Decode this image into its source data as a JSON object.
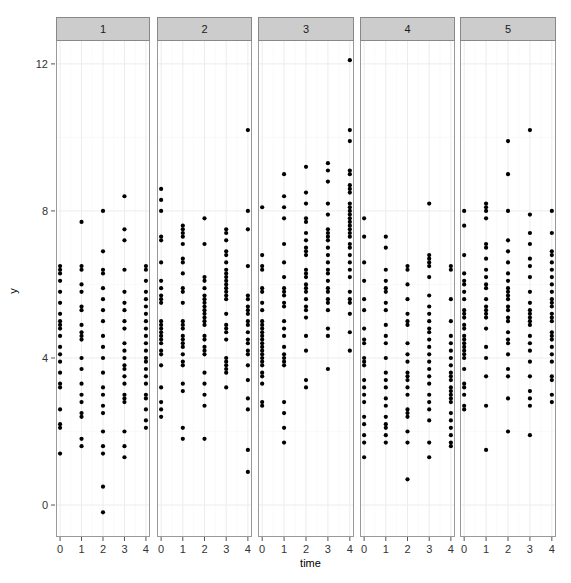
{
  "chart_data": {
    "type": "scatter",
    "title": "",
    "xlabel": "time",
    "ylabel": "y",
    "facet_labels": [
      "1",
      "2",
      "3",
      "4",
      "5"
    ],
    "x_ticks": [
      0,
      1,
      2,
      3,
      4
    ],
    "y_ticks": [
      0,
      4,
      8,
      12
    ],
    "xlim": [
      -0.19,
      4.19
    ],
    "ylim": [
      -0.87,
      12.65
    ],
    "grid": true,
    "legend": null,
    "colors": {
      "point": "#000000",
      "strip_bg": "#cccccc",
      "strip_border": "#888888",
      "panel_border": "#999999",
      "grid_major": "#ececec",
      "grid_minor": "#f6f6f6",
      "text": "#000000",
      "tick_text": "#333333"
    },
    "panels": [
      {
        "facet": "1",
        "series": [
          {
            "x": 0,
            "values": [
              6.5,
              6.4,
              6.3,
              6.1,
              5.8,
              5.5,
              5.2,
              5.0,
              4.9,
              4.8,
              4.6,
              4.3,
              4.1,
              3.9,
              3.6,
              3.3,
              3.2,
              2.6,
              2.2,
              2.1,
              1.4
            ]
          },
          {
            "x": 1,
            "values": [
              7.7,
              6.5,
              6.4,
              6.0,
              5.8,
              5.4,
              5.3,
              4.9,
              4.7,
              4.6,
              4.5,
              4.0,
              3.7,
              3.3,
              3.0,
              2.8,
              2.5,
              2.4,
              1.8,
              1.6
            ]
          },
          {
            "x": 2,
            "values": [
              8.0,
              6.9,
              6.4,
              6.3,
              5.9,
              5.6,
              5.3,
              5.0,
              4.6,
              4.3,
              4.0,
              3.6,
              3.2,
              3.0,
              2.7,
              2.5,
              2.0,
              1.6,
              1.4,
              0.5,
              -0.2
            ]
          },
          {
            "x": 3,
            "values": [
              8.4,
              7.5,
              7.2,
              6.4,
              5.8,
              5.5,
              5.3,
              5.0,
              4.8,
              4.4,
              4.2,
              4.0,
              3.8,
              3.7,
              3.5,
              3.3,
              3.0,
              2.9,
              2.8,
              2.0,
              1.6,
              1.3
            ]
          },
          {
            "x": 4,
            "values": [
              6.5,
              6.4,
              6.1,
              5.8,
              5.6,
              5.4,
              5.2,
              5.0,
              4.8,
              4.6,
              4.4,
              4.2,
              4.0,
              3.9,
              3.7,
              3.5,
              3.3,
              3.0,
              2.9,
              2.6,
              2.3,
              2.1
            ]
          }
        ]
      },
      {
        "facet": "2",
        "series": [
          {
            "x": 0,
            "values": [
              8.6,
              8.3,
              8.0,
              7.3,
              7.2,
              6.6,
              6.1,
              5.9,
              5.7,
              5.6,
              5.5,
              5.0,
              4.9,
              4.8,
              4.7,
              4.6,
              4.5,
              4.4,
              4.2,
              4.1,
              3.8,
              3.2,
              2.8,
              2.6,
              2.4
            ]
          },
          {
            "x": 1,
            "values": [
              7.6,
              7.5,
              7.4,
              7.3,
              7.1,
              6.7,
              6.6,
              6.3,
              5.9,
              5.8,
              5.5,
              5.0,
              4.9,
              4.8,
              4.6,
              4.5,
              4.4,
              4.3,
              4.1,
              3.9,
              3.8,
              3.3,
              3.1,
              2.1,
              1.8
            ]
          },
          {
            "x": 2,
            "values": [
              7.8,
              7.1,
              6.2,
              6.1,
              5.9,
              5.7,
              5.6,
              5.5,
              5.4,
              5.3,
              5.2,
              5.1,
              5.0,
              4.9,
              4.6,
              4.5,
              4.3,
              4.2,
              4.1,
              3.6,
              3.3,
              3.0,
              2.7,
              1.8
            ]
          },
          {
            "x": 3,
            "values": [
              7.5,
              7.4,
              7.2,
              6.9,
              6.8,
              6.6,
              6.4,
              6.3,
              6.2,
              6.1,
              6.0,
              5.9,
              5.8,
              5.7,
              5.6,
              5.2,
              4.9,
              4.8,
              4.7,
              4.5,
              4.0,
              3.9,
              3.8,
              3.7,
              3.6,
              3.2
            ]
          },
          {
            "x": 4,
            "values": [
              10.2,
              8.0,
              7.5,
              6.5,
              5.7,
              5.6,
              5.4,
              5.3,
              5.2,
              5.0,
              4.9,
              4.7,
              4.5,
              4.4,
              4.2,
              4.1,
              3.8,
              3.4,
              2.9,
              2.6,
              1.5,
              0.9
            ]
          }
        ]
      },
      {
        "facet": "3",
        "series": [
          {
            "x": 0,
            "values": [
              8.1,
              6.8,
              6.5,
              6.4,
              5.9,
              5.8,
              5.5,
              5.3,
              5.0,
              4.9,
              4.8,
              4.7,
              4.6,
              4.5,
              4.4,
              4.3,
              4.2,
              4.1,
              4.0,
              3.9,
              3.8,
              3.6,
              3.5,
              3.3,
              2.8,
              2.7
            ]
          },
          {
            "x": 1,
            "values": [
              9.0,
              8.4,
              8.1,
              7.8,
              7.1,
              6.6,
              6.2,
              5.9,
              5.8,
              5.7,
              5.5,
              5.4,
              5.0,
              4.8,
              4.6,
              4.3,
              4.1,
              4.0,
              3.9,
              3.8,
              2.8,
              2.5,
              2.1,
              1.7
            ]
          },
          {
            "x": 2,
            "values": [
              9.2,
              8.5,
              8.2,
              7.8,
              7.7,
              7.4,
              7.2,
              7.0,
              6.9,
              6.8,
              6.4,
              6.3,
              6.2,
              6.0,
              5.9,
              5.8,
              5.6,
              5.4,
              5.3,
              5.1,
              4.6,
              4.2,
              3.4,
              3.2
            ]
          },
          {
            "x": 3,
            "values": [
              9.3,
              9.1,
              8.8,
              8.2,
              7.9,
              7.5,
              7.4,
              7.3,
              7.2,
              7.0,
              6.8,
              6.6,
              6.4,
              6.3,
              6.1,
              5.9,
              5.8,
              5.6,
              5.5,
              5.3,
              4.8,
              4.6,
              3.7
            ]
          },
          {
            "x": 4,
            "values": [
              12.1,
              10.2,
              9.9,
              9.1,
              9.0,
              8.7,
              8.6,
              8.5,
              8.2,
              8.1,
              8.0,
              7.9,
              7.8,
              7.7,
              7.6,
              7.5,
              7.4,
              7.3,
              7.1,
              7.0,
              6.8,
              6.6,
              6.4,
              6.2,
              5.8,
              5.6,
              5.5,
              5.2,
              4.7,
              4.2
            ]
          }
        ]
      },
      {
        "facet": "4",
        "series": [
          {
            "x": 0,
            "values": [
              7.8,
              7.3,
              6.6,
              6.1,
              5.6,
              5.3,
              4.8,
              4.5,
              4.4,
              4.0,
              3.9,
              3.8,
              3.4,
              3.2,
              3.0,
              2.8,
              2.4,
              2.2,
              1.9,
              1.7,
              1.3
            ]
          },
          {
            "x": 1,
            "values": [
              7.3,
              7.0,
              6.4,
              6.1,
              5.9,
              5.8,
              5.5,
              5.3,
              4.9,
              4.6,
              4.4,
              4.0,
              3.6,
              3.4,
              3.2,
              2.9,
              2.7,
              2.4,
              2.2,
              2.1,
              1.9,
              1.7
            ]
          },
          {
            "x": 2,
            "values": [
              6.5,
              6.4,
              6.0,
              5.6,
              5.2,
              5.0,
              4.9,
              4.4,
              4.1,
              3.9,
              3.6,
              3.5,
              3.4,
              3.2,
              3.0,
              2.6,
              2.5,
              2.4,
              2.0,
              1.7,
              0.7
            ]
          },
          {
            "x": 3,
            "values": [
              8.2,
              6.8,
              6.7,
              6.6,
              6.5,
              6.2,
              5.7,
              5.4,
              5.2,
              5.0,
              4.8,
              4.7,
              4.5,
              4.3,
              4.1,
              3.9,
              3.7,
              3.5,
              3.3,
              3.0,
              2.8,
              2.6,
              2.3,
              1.7,
              1.3
            ]
          },
          {
            "x": 4,
            "values": [
              6.5,
              6.4,
              5.6,
              5.0,
              4.6,
              4.4,
              4.2,
              4.0,
              3.8,
              3.6,
              3.5,
              3.4,
              3.2,
              3.1,
              3.0,
              2.9,
              2.8,
              2.5,
              2.3,
              2.1,
              1.9,
              1.7,
              1.6
            ]
          }
        ]
      },
      {
        "facet": "5",
        "series": [
          {
            "x": 0,
            "values": [
              8.0,
              7.6,
              6.8,
              6.3,
              6.1,
              6.0,
              5.8,
              5.6,
              5.3,
              5.2,
              5.1,
              4.9,
              4.8,
              4.6,
              4.5,
              4.4,
              4.3,
              4.2,
              4.1,
              4.0,
              3.7,
              3.3,
              3.2,
              3.0,
              2.7,
              2.6
            ]
          },
          {
            "x": 1,
            "values": [
              8.2,
              8.1,
              8.0,
              7.8,
              7.1,
              7.0,
              6.7,
              6.4,
              6.2,
              6.0,
              5.9,
              5.6,
              5.4,
              5.3,
              5.2,
              5.1,
              4.8,
              4.3,
              4.0,
              3.5,
              2.7,
              1.5
            ]
          },
          {
            "x": 2,
            "values": [
              9.9,
              9.0,
              8.0,
              7.2,
              6.9,
              6.6,
              6.3,
              6.1,
              5.9,
              5.8,
              5.7,
              5.6,
              5.4,
              5.3,
              5.1,
              5.0,
              4.7,
              4.5,
              4.4,
              4.1,
              3.7,
              3.5,
              2.9,
              2.0
            ]
          },
          {
            "x": 3,
            "values": [
              10.2,
              7.9,
              7.4,
              7.1,
              6.7,
              6.5,
              6.2,
              5.8,
              5.5,
              5.3,
              5.2,
              5.1,
              5.0,
              4.9,
              4.6,
              4.4,
              4.2,
              3.9,
              3.5,
              3.1,
              2.9,
              2.7,
              1.9
            ]
          },
          {
            "x": 4,
            "values": [
              8.0,
              7.4,
              6.9,
              6.8,
              6.6,
              6.4,
              6.2,
              6.0,
              5.8,
              5.6,
              5.5,
              5.4,
              5.2,
              5.1,
              5.0,
              4.7,
              4.6,
              4.5,
              4.3,
              4.1,
              3.9,
              3.5,
              3.4,
              3.0,
              2.8
            ]
          }
        ]
      }
    ]
  },
  "labels": {
    "x_axis": "time",
    "y_axis": "y"
  }
}
